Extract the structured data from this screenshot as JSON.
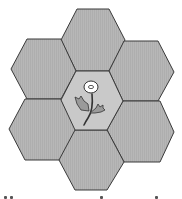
{
  "figure": {
    "hexagon_count": 7,
    "colors": {
      "outer_fill": "#b4b4b4",
      "center_fill": "#c9c9c9",
      "outline": "#3a3a3a",
      "flower_head": "#ffffff",
      "leaf": "#9a9a9a"
    },
    "hexagons": [
      {
        "id": "top",
        "points": "77,9 109,9 125,40 109,71 76,71 61,40"
      },
      {
        "id": "upper-left",
        "points": "27,39 61,39 76,71 61,99 27,99 11,69"
      },
      {
        "id": "upper-right",
        "points": "124,41 158,41 174,72 158,101 123,101 109,71"
      },
      {
        "id": "lower-left",
        "points": "25,99 61,99 76,130 60,160 25,160 9,129"
      },
      {
        "id": "lower-right",
        "points": "123,101 160,101 174,132 160,162 124,162 107,130"
      },
      {
        "id": "bottom",
        "points": "75,130 107,130 124,162 107,190 75,190 59,160"
      },
      {
        "id": "center",
        "points": "76,71 109,71 123,101 107,130 75,130 61,100"
      }
    ],
    "center_icon": "flower-icon"
  }
}
